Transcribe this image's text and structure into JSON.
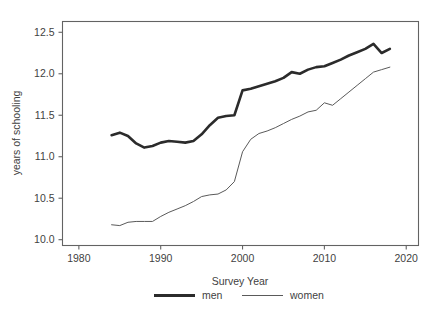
{
  "chart_data": {
    "type": "line",
    "title": "",
    "xlabel": "Survey Year",
    "ylabel": "years of schooling",
    "xlim": [
      1978,
      2021.5
    ],
    "ylim": [
      9.93,
      12.63
    ],
    "xticks": [
      1980,
      1990,
      2000,
      2010,
      2020
    ],
    "yticks": [
      10.0,
      10.5,
      11.0,
      11.5,
      12.0,
      12.5
    ],
    "xtick_labels": [
      "1980",
      "1990",
      "2000",
      "2010",
      "2020"
    ],
    "ytick_labels": [
      "10.0",
      "10.5",
      "11.0",
      "11.5",
      "12.0",
      "12.5"
    ],
    "grid": false,
    "legend_position": "below",
    "x": [
      1984,
      1985,
      1986,
      1987,
      1988,
      1989,
      1990,
      1991,
      1992,
      1993,
      1994,
      1995,
      1996,
      1997,
      1998,
      1999,
      2000,
      2001,
      2002,
      2003,
      2004,
      2005,
      2006,
      2007,
      2008,
      2009,
      2010,
      2011,
      2012,
      2013,
      2014,
      2015,
      2016,
      2017,
      2018
    ],
    "series": [
      {
        "name": "men",
        "color": "#2b2b2b",
        "linewidth": 2.6,
        "values": [
          11.26,
          11.29,
          11.25,
          11.16,
          11.11,
          11.13,
          11.17,
          11.19,
          11.18,
          11.17,
          11.19,
          11.27,
          11.38,
          11.47,
          11.49,
          11.5,
          11.8,
          11.82,
          11.85,
          11.88,
          11.91,
          11.95,
          12.02,
          12.0,
          12.05,
          12.08,
          12.09,
          12.13,
          12.17,
          12.22,
          12.26,
          12.3,
          12.36,
          12.25,
          12.3
        ]
      },
      {
        "name": "women",
        "color": "#5a5a5a",
        "linewidth": 1.0,
        "values": [
          10.18,
          10.17,
          10.21,
          10.22,
          10.22,
          10.22,
          10.28,
          10.33,
          10.37,
          10.41,
          10.46,
          10.52,
          10.54,
          10.55,
          10.6,
          10.7,
          11.06,
          11.21,
          11.28,
          11.31,
          11.35,
          11.4,
          11.45,
          11.49,
          11.54,
          11.56,
          11.65,
          11.62,
          11.7,
          11.78,
          11.86,
          11.94,
          12.02,
          12.05,
          12.08
        ]
      }
    ],
    "legend": [
      {
        "label": "men",
        "style": "thick-line"
      },
      {
        "label": "women",
        "style": "thin-line"
      }
    ],
    "colors": {
      "men": "#2b2b2b",
      "women": "#5a5a5a",
      "axis": "#636363",
      "text": "#3f3f3f",
      "background": "#ffffff"
    }
  }
}
